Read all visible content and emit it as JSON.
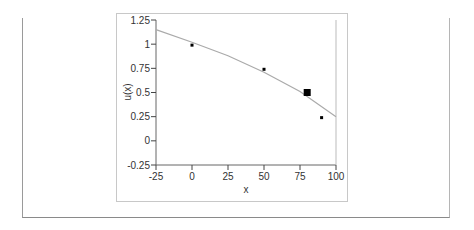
{
  "chart_data": {
    "type": "scatter",
    "title": "",
    "xlabel": "x",
    "ylabel": "u(x)",
    "xlim": [
      -25,
      100
    ],
    "ylim": [
      -0.25,
      1.25
    ],
    "xticks": [
      -25,
      0,
      25,
      50,
      75,
      100
    ],
    "yticks": [
      1.25,
      1,
      0.75,
      0.5,
      0.25,
      0,
      -0.25
    ],
    "xtick_labels": [
      "-25",
      "0",
      "25",
      "50",
      "75",
      "100"
    ],
    "ytick_labels": [
      "1.25",
      "1",
      "0.75",
      "0.5",
      "0.25",
      "0",
      "-0.25"
    ],
    "grid": false,
    "series": [
      {
        "name": "observed points",
        "kind": "scatter",
        "marker": "small-square",
        "x": [
          0,
          50,
          90
        ],
        "y": [
          0.99,
          0.74,
          0.24
        ]
      },
      {
        "name": "highlighted point",
        "kind": "scatter",
        "marker": "large-square",
        "x": [
          80
        ],
        "y": [
          0.5
        ]
      },
      {
        "name": "fitted curve",
        "kind": "line",
        "color": "#aaaaaa",
        "x": [
          -25,
          0,
          25,
          50,
          75,
          100
        ],
        "y": [
          1.15,
          1.02,
          0.88,
          0.71,
          0.51,
          0.25
        ]
      }
    ]
  }
}
